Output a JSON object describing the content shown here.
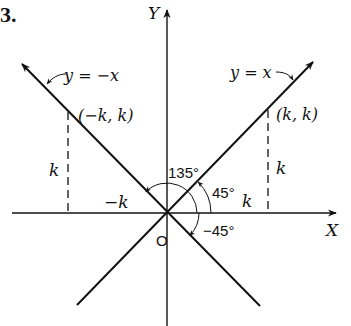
{
  "figure": {
    "number_label": "3.",
    "axes": {
      "x_label": "X",
      "y_label": "Y",
      "origin_label": "O"
    },
    "lines": [
      {
        "name": "y-equals-x",
        "equation": "y = x",
        "slope": 1
      },
      {
        "name": "y-equals-neg-x",
        "equation": "y = −x",
        "slope": -1
      }
    ],
    "points": [
      {
        "name": "point-k-k",
        "label": "(k, k)",
        "x": "k",
        "y": "k"
      },
      {
        "name": "point-neg-k-k",
        "label": "(−k, k)",
        "x": "-k",
        "y": "k"
      }
    ],
    "segment_labels": {
      "right_vertical": "k",
      "right_horizontal": "k",
      "left_vertical": "k",
      "left_horizontal": "−k"
    },
    "angles": [
      {
        "name": "angle-45",
        "label": "45°",
        "degrees": 45
      },
      {
        "name": "angle-135",
        "label": "135°",
        "degrees": 135
      },
      {
        "name": "angle-neg-45",
        "label": "−45°",
        "degrees": -45
      }
    ],
    "colors": {
      "ink": "#111111",
      "background": "#ffffff"
    }
  }
}
